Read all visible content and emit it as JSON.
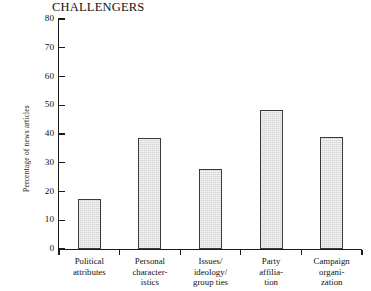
{
  "chart_data": {
    "type": "bar",
    "title": "CHALLENGERS",
    "xlabel": "",
    "ylabel": "Percentage of news articles",
    "ylim": [
      0,
      80
    ],
    "ytick_step": 10,
    "yticks": [
      80,
      70,
      60,
      50,
      40,
      30,
      20,
      10,
      0
    ],
    "ytick_labels": [
      "80",
      "70",
      "60",
      "50",
      "40",
      "30",
      "20",
      "10",
      "0"
    ],
    "grid": false,
    "legend": null,
    "categories": [
      "Political attributes",
      "Personal characteristics",
      "Issues/ ideology/ group ties",
      "Party affiliation",
      "Campaign organization"
    ],
    "category_lines": [
      [
        "Political",
        "attributes"
      ],
      [
        "Personal",
        "character-",
        "istics"
      ],
      [
        "Issues/",
        "ideology/",
        "group ties"
      ],
      [
        "Party",
        "affilia-",
        "tion"
      ],
      [
        "Campaign",
        "organi-",
        "zation"
      ]
    ],
    "values": [
      17.5,
      38.5,
      28,
      48.5,
      39
    ],
    "bar_fill_color": "#d4d4d4",
    "bar_edge_color": "#3a3a3a",
    "axis_color": "#1a1a1a",
    "background_color": "#ffffff"
  }
}
